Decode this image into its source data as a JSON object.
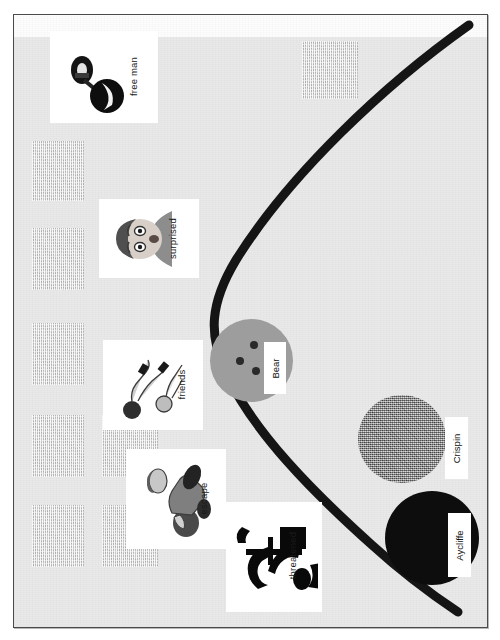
{
  "figure": {
    "kind": "scanned-diagram",
    "orientation": "rotated-90",
    "page_bg": "#e9e9e9",
    "border_color": "#4a4a4a"
  },
  "curve": {
    "name": "story-arc-curve",
    "color": "#151515",
    "stroke_width": 9,
    "description": "thick parabola opening right, vertex at left-center"
  },
  "nodes": [
    {
      "id": "bear",
      "label": "Bear",
      "shape": "circle",
      "fill": "#9d9d9d",
      "fill_style": "solid-gray-with-dots",
      "cx": 259,
      "cy": 358,
      "r": 41
    },
    {
      "id": "crispin",
      "label": "Crispin",
      "shape": "circle",
      "fill": "#8b8b8b",
      "fill_style": "dithered-noise",
      "cx": 432,
      "cy": 437,
      "r": 44
    },
    {
      "id": "aycliffe",
      "label": "Aycliffe",
      "shape": "circle",
      "fill": "#0d0d0d",
      "fill_style": "solid-black",
      "cx": 435,
      "cy": 537,
      "r": 47
    }
  ],
  "cards": [
    {
      "id": "free-man",
      "label": "free man",
      "thumb": "ball-and-chain-shackle"
    },
    {
      "id": "surprised",
      "label": "surprised",
      "thumb": "surprised-face-portrait"
    },
    {
      "id": "friends",
      "label": "friends",
      "thumb": "two-figures-lying"
    },
    {
      "id": "escape",
      "label": "escape",
      "thumb": "crouching-figure"
    },
    {
      "id": "threatened",
      "label": "threatened",
      "thumb": "silhouette-figures-struggle"
    }
  ],
  "placeholders": {
    "name": "textured-square",
    "fill": "#d2d2d2",
    "count": 9
  },
  "margin_caption": ""
}
